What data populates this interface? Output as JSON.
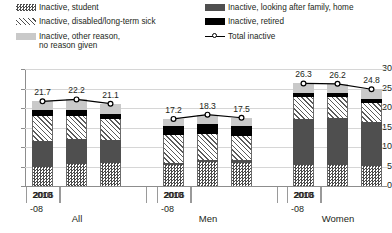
{
  "legend": {
    "items": [
      {
        "key": "student",
        "label": "Inactive, student",
        "label2": "",
        "swatch": "checkerboard-swatch",
        "color": "#4d4d4d"
      },
      {
        "key": "sick",
        "label": "Inactive, disabled/long-term sick",
        "label2": "",
        "swatch": "diagonal-hatch-swatch",
        "color": "#4d4d4d"
      },
      {
        "key": "other",
        "label": "Inactive, other reason,",
        "label2": "no reason given",
        "swatch": "light-gray-swatch",
        "color": "#c9c9c9"
      },
      {
        "key": "family",
        "label": "Inactive, looking after family, home",
        "label2": "",
        "swatch": "dark-gray-swatch",
        "color": "#4f4f4f"
      },
      {
        "key": "retired",
        "label": "Inactive, retired",
        "label2": "",
        "swatch": "black-swatch",
        "color": "#000000"
      },
      {
        "key": "total",
        "label": "Total inactive",
        "label2": "",
        "swatch": "line-marker-swatch",
        "color": "#000000"
      }
    ]
  },
  "chart_data": {
    "type": "bar",
    "stacked": true,
    "title": "",
    "subtitle": "",
    "xlabel": "",
    "ylabel": "",
    "ylim": [
      0,
      30
    ],
    "yticks": [
      "0",
      "5",
      "10",
      "15",
      "20",
      "25",
      "30"
    ],
    "ytick_values": [
      0,
      5,
      10,
      15,
      20,
      25,
      30
    ],
    "grid": true,
    "legend_position": "top",
    "groups": [
      {
        "name": "All",
        "categories": [
          "2006",
          "2010",
          "2013"
        ],
        "category_sub": [
          "-08",
          "",
          ""
        ]
      },
      {
        "name": "Men",
        "categories": [
          "2006",
          "2010",
          "2013"
        ],
        "category_sub": [
          "-08",
          "",
          ""
        ]
      },
      {
        "name": "Women",
        "categories": [
          "2006",
          "2010",
          "2013"
        ],
        "category_sub": [
          "-08",
          "",
          ""
        ]
      }
    ],
    "x": [
      "All 2006-08",
      "All 2010",
      "All 2013",
      "Men 2006-08",
      "Men 2010",
      "Men 2013",
      "Women 2006-08",
      "Women 2010",
      "Women 2013"
    ],
    "series": [
      {
        "name": "Inactive, student",
        "key": "student",
        "values": [
          5.0,
          5.7,
          5.8,
          5.3,
          6.2,
          6.0,
          5.3,
          5.4,
          5.2
        ]
      },
      {
        "name": "Inactive, looking after family, home",
        "key": "family",
        "values": [
          6.5,
          6.3,
          5.9,
          0.5,
          0.6,
          0.7,
          12.0,
          12.0,
          11.2
        ]
      },
      {
        "name": "Inactive, disabled/long-term sick",
        "key": "sick",
        "values": [
          6.5,
          6.0,
          5.5,
          7.2,
          6.5,
          6.1,
          5.6,
          5.5,
          5.0
        ]
      },
      {
        "name": "Inactive, retired",
        "key": "retired",
        "values": [
          1.5,
          1.5,
          1.4,
          2.3,
          2.5,
          2.5,
          0.9,
          0.9,
          0.8
        ]
      },
      {
        "name": "Inactive, other reason, no reason given",
        "key": "other",
        "values": [
          2.2,
          2.7,
          2.5,
          1.9,
          2.5,
          2.2,
          2.5,
          2.4,
          2.6
        ]
      }
    ],
    "total_line": {
      "name": "Total inactive",
      "values": [
        21.7,
        22.2,
        21.1,
        17.2,
        18.3,
        17.5,
        26.3,
        26.2,
        24.8
      ],
      "labels": [
        "21.7",
        "22.2",
        "21.1",
        "17.2",
        "18.3",
        "17.5",
        "26.3",
        "26.2",
        "24.8"
      ]
    }
  }
}
